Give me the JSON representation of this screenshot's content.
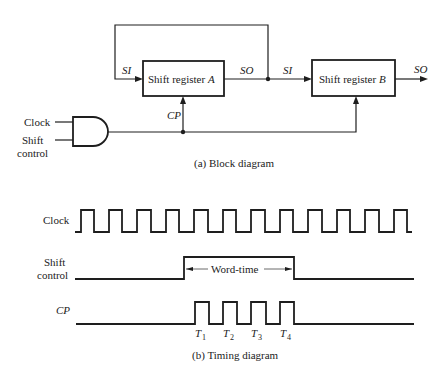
{
  "block_diagram": {
    "caption": "(a) Block diagram",
    "register_a": {
      "label_prefix": "Shift register ",
      "label_var": "A",
      "input_label": "SI",
      "output_label": "SO",
      "clock_label": "CP"
    },
    "register_b": {
      "label_prefix": "Shift register ",
      "label_var": "B",
      "input_label": "SI",
      "output_label": "SO"
    },
    "and_gate": {
      "input_1": "Clock",
      "input_2_line1": "Shift",
      "input_2_line2": "control"
    }
  },
  "timing_diagram": {
    "caption": "(b) Timing diagram",
    "signals": [
      {
        "name": "Clock",
        "line1": "Clock"
      },
      {
        "name": "Shift control",
        "line1": "Shift",
        "line2": "control"
      },
      {
        "name": "CP",
        "line1": "CP"
      }
    ],
    "word_time_label": "Word-time",
    "pulse_labels": [
      {
        "base": "T",
        "sub": "1"
      },
      {
        "base": "T",
        "sub": "2"
      },
      {
        "base": "T",
        "sub": "3"
      },
      {
        "base": "T",
        "sub": "4"
      }
    ],
    "clock_cycles": 12,
    "cp_pulses": 4
  },
  "colors": {
    "ink": "#1e1e1e",
    "background": "#ffffff"
  }
}
